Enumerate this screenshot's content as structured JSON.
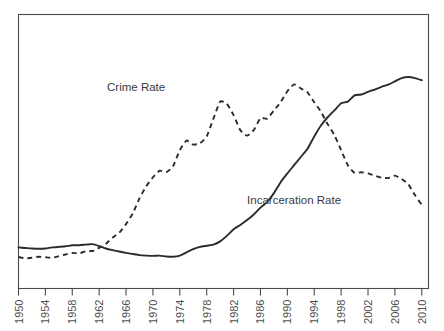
{
  "chart_data": {
    "type": "line",
    "title": "",
    "subtitle": "",
    "xlabel": "",
    "ylabel": "",
    "grid": false,
    "legend_position": "inline-annotations",
    "xlim": [
      1950,
      2011
    ],
    "ylim": [
      0,
      100
    ],
    "xticks": [
      1950,
      1954,
      1958,
      1962,
      1966,
      1970,
      1974,
      1978,
      1982,
      1986,
      1990,
      1994,
      1998,
      2002,
      2006,
      2010
    ],
    "xtick_labels": [
      "1950",
      "1954",
      "1958",
      "1962",
      "1966",
      "1970",
      "1974",
      "1978",
      "1982",
      "1986",
      "1990",
      "1994",
      "1998",
      "2002",
      "2006",
      "2010"
    ],
    "yticks": [],
    "ytick_labels": [],
    "annotations": [
      {
        "text": "Crime Rate",
        "x": 1967.5,
        "y": 72,
        "name": "crime-rate-label"
      },
      {
        "text": "Incarceration Rate",
        "x": 1991.0,
        "y": 31,
        "name": "incarceration-rate-label"
      }
    ],
    "series": [
      {
        "name": "Crime Rate",
        "style": "dashed",
        "x": [
          1950,
          1951,
          1952,
          1953,
          1954,
          1955,
          1956,
          1957,
          1958,
          1959,
          1960,
          1961,
          1962,
          1963,
          1964,
          1965,
          1966,
          1967,
          1968,
          1969,
          1970,
          1971,
          1972,
          1973,
          1974,
          1975,
          1976,
          1977,
          1978,
          1979,
          1980,
          1981,
          1982,
          1983,
          1984,
          1985,
          1986,
          1987,
          1988,
          1989,
          1990,
          1991,
          1992,
          1993,
          1994,
          1995,
          1996,
          1997,
          1998,
          1999,
          2000,
          2001,
          2002,
          2003,
          2004,
          2005,
          2006,
          2007,
          2008,
          2009,
          2010
        ],
        "values": [
          11.5,
          11.0,
          11.2,
          11.6,
          11.4,
          11.2,
          11.8,
          12.4,
          13.0,
          12.8,
          13.6,
          13.7,
          14.8,
          16.3,
          18.6,
          20.4,
          23.5,
          27.4,
          32.9,
          37.3,
          40.6,
          43.0,
          42.5,
          44.6,
          50.5,
          54.0,
          52.5,
          53.0,
          55.5,
          62.0,
          68.2,
          67.4,
          63.3,
          57.8,
          55.8,
          57.8,
          62.2,
          62.0,
          65.0,
          68.0,
          72.0,
          74.5,
          73.0,
          71.6,
          68.0,
          64.5,
          60.0,
          56.0,
          50.5,
          45.0,
          42.2,
          42.4,
          42.0,
          41.2,
          40.5,
          40.3,
          41.2,
          40.0,
          38.0,
          34.0,
          30.5
        ]
      },
      {
        "name": "Incarceration Rate",
        "style": "solid",
        "x": [
          1950,
          1951,
          1952,
          1953,
          1954,
          1955,
          1956,
          1957,
          1958,
          1959,
          1960,
          1961,
          1962,
          1963,
          1964,
          1965,
          1966,
          1967,
          1968,
          1969,
          1970,
          1971,
          1972,
          1973,
          1974,
          1975,
          1976,
          1977,
          1978,
          1979,
          1980,
          1981,
          1982,
          1983,
          1984,
          1985,
          1986,
          1987,
          1988,
          1989,
          1990,
          1991,
          1992,
          1993,
          1994,
          1995,
          1996,
          1997,
          1998,
          1999,
          2000,
          2001,
          2002,
          2003,
          2004,
          2005,
          2006,
          2007,
          2008,
          2009,
          2010
        ],
        "values": [
          15.0,
          14.8,
          14.6,
          14.5,
          14.6,
          15.0,
          15.2,
          15.4,
          15.8,
          15.8,
          16.0,
          16.2,
          15.5,
          14.6,
          14.0,
          13.5,
          13.0,
          12.6,
          12.2,
          12.0,
          11.9,
          12.0,
          11.7,
          11.6,
          12.0,
          13.2,
          14.4,
          15.2,
          15.6,
          16.0,
          17.2,
          19.2,
          21.6,
          23.2,
          25.0,
          27.0,
          29.5,
          31.6,
          34.8,
          38.8,
          42.0,
          45.0,
          48.0,
          51.0,
          55.5,
          59.5,
          62.5,
          65.0,
          67.6,
          68.2,
          70.5,
          70.8,
          71.8,
          72.6,
          73.6,
          74.4,
          75.6,
          76.8,
          77.2,
          76.8,
          76.0
        ]
      }
    ]
  },
  "figure": {
    "plot_frame_name": "plot-border"
  }
}
